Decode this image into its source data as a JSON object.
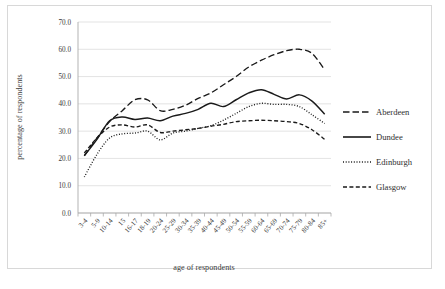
{
  "chart_data": {
    "type": "line",
    "title": "",
    "xlabel": "age of respondents",
    "ylabel": "percentage of respondents",
    "ylim": [
      0,
      70
    ],
    "ytick_step": 10,
    "ytick_labels": [
      "0.0",
      "10.0",
      "20.0",
      "30.0",
      "40.0",
      "50.0",
      "60.0",
      "70.0"
    ],
    "ytick_values": [
      0,
      10,
      20,
      30,
      40,
      50,
      60,
      70
    ],
    "grid": true,
    "legend_position": "right",
    "categories": [
      "3-4",
      "5-9",
      "10-14",
      "15",
      "16-17",
      "18-19",
      "20-24",
      "25-29",
      "30-34",
      "35-39",
      "40-44",
      "45-49",
      "50-54",
      "55-59",
      "60-64",
      "65-69",
      "70-74",
      "75-79",
      "80-84",
      "85+"
    ],
    "series": [
      {
        "name": "Aberdeen",
        "style": "long-dash",
        "color": "#1a1a1a",
        "values": [
          21.0,
          27.5,
          33.5,
          37.5,
          41.5,
          41.5,
          37.5,
          38.0,
          39.5,
          42.0,
          44.0,
          47.0,
          50.0,
          53.5,
          56.0,
          58.0,
          59.5,
          60.0,
          58.5,
          52.5
        ]
      },
      {
        "name": "Dundee",
        "style": "solid",
        "color": "#1a1a1a",
        "values": [
          21.0,
          27.0,
          33.8,
          35.2,
          34.3,
          34.8,
          33.8,
          35.5,
          36.5,
          38.0,
          40.2,
          39.0,
          41.5,
          44.0,
          45.2,
          43.5,
          41.8,
          43.3,
          41.0,
          36.2
        ]
      },
      {
        "name": "Edinburgh",
        "style": "dotted",
        "color": "#1a1a1a",
        "values": [
          13.2,
          21.5,
          27.5,
          29.0,
          29.3,
          30.0,
          26.8,
          29.3,
          30.0,
          31.0,
          32.0,
          34.0,
          36.5,
          39.0,
          40.2,
          39.8,
          39.8,
          39.0,
          36.0,
          32.8
        ]
      },
      {
        "name": "Glasgow",
        "style": "medium-dash",
        "color": "#1a1a1a",
        "values": [
          22.0,
          27.5,
          31.5,
          32.3,
          31.5,
          32.3,
          29.5,
          30.0,
          30.5,
          31.0,
          31.8,
          32.5,
          33.5,
          33.8,
          34.0,
          33.8,
          33.5,
          32.8,
          30.5,
          27.0
        ]
      }
    ]
  },
  "legend": {
    "items": [
      {
        "label": "Aberdeen"
      },
      {
        "label": "Dundee"
      },
      {
        "label": "Edinburgh"
      },
      {
        "label": "Glasgow"
      }
    ]
  },
  "colors": {
    "line": "#1a1a1a",
    "grid": "#dcdcdc",
    "axis": "#aaaaaa",
    "frame": "#d8d8d8",
    "background": "#ffffff"
  }
}
